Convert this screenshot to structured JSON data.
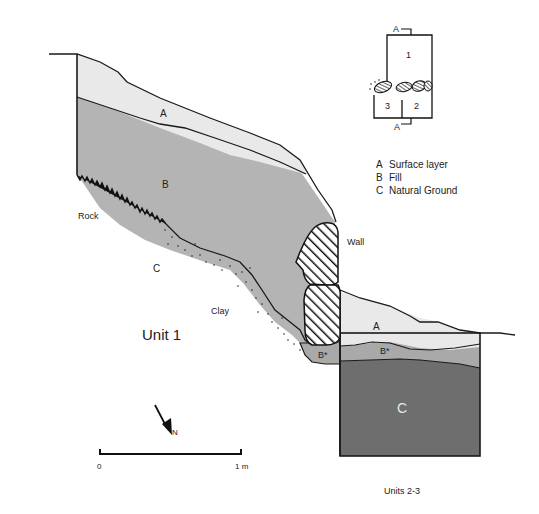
{
  "diagram": {
    "title": "Unit 1",
    "subtitle": "Units 2-3",
    "layer_labels": {
      "a_unit1": "A",
      "b_unit1": "B",
      "c_unit1": "C",
      "b_star_left": "B*",
      "a_units23": "A",
      "b_star_right": "B*",
      "c_units23": "C"
    },
    "feature_labels": {
      "rock": "Rock",
      "clay": "Clay",
      "wall": "Wall"
    },
    "legend": [
      {
        "key": "A",
        "label": "Surface layer"
      },
      {
        "key": "B",
        "label": "Fill"
      },
      {
        "key": "C",
        "label": "Natural Ground"
      }
    ],
    "key_plan": {
      "section_top": "A",
      "section_bottom": "A",
      "rooms": [
        "1",
        "2",
        "3"
      ]
    },
    "scale_bar": {
      "start": "0",
      "end": "1 m"
    },
    "north_arrow": {
      "label": "N"
    },
    "colors": {
      "surface_layer": "#e9e9e9",
      "fill": "#b4b4b4",
      "fill_star": "#a9a9a9",
      "natural_ground": "#6e6e6e",
      "line": "#1a1a1a"
    }
  }
}
